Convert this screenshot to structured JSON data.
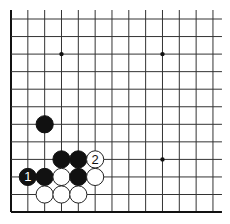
{
  "board": {
    "type": "go-diagram",
    "visible_columns": 13,
    "visible_rows": 12,
    "edges": {
      "left": true,
      "bottom": true,
      "top": false,
      "right": false
    },
    "grid": {
      "x0": 11,
      "y0": 19,
      "dx": 16.83,
      "dy": 17.55,
      "extend_top": 9,
      "extend_right": 9,
      "line_color": "#333333",
      "edge_color": "#111111"
    },
    "star_points": [
      {
        "col": 3,
        "row": 2
      },
      {
        "col": 9,
        "row": 2
      },
      {
        "col": 9,
        "row": 8
      }
    ],
    "stone_radius": 8.6,
    "stones": [
      {
        "col": 2,
        "row": 6,
        "color": "black",
        "label": ""
      },
      {
        "col": 3,
        "row": 8,
        "color": "black",
        "label": ""
      },
      {
        "col": 4,
        "row": 8,
        "color": "black",
        "label": ""
      },
      {
        "col": 5,
        "row": 8,
        "color": "white",
        "label": "2"
      },
      {
        "col": 1,
        "row": 9,
        "color": "black",
        "label": "1"
      },
      {
        "col": 2,
        "row": 9,
        "color": "black",
        "label": ""
      },
      {
        "col": 3,
        "row": 9,
        "color": "white",
        "label": ""
      },
      {
        "col": 4,
        "row": 9,
        "color": "black",
        "label": ""
      },
      {
        "col": 5,
        "row": 9,
        "color": "white",
        "label": ""
      },
      {
        "col": 2,
        "row": 10,
        "color": "white",
        "label": ""
      },
      {
        "col": 3,
        "row": 10,
        "color": "white",
        "label": ""
      },
      {
        "col": 4,
        "row": 10,
        "color": "white",
        "label": ""
      }
    ],
    "colors": {
      "black_stone": "#111111",
      "white_stone": "#ffffff",
      "white_outline": "#222222"
    }
  }
}
